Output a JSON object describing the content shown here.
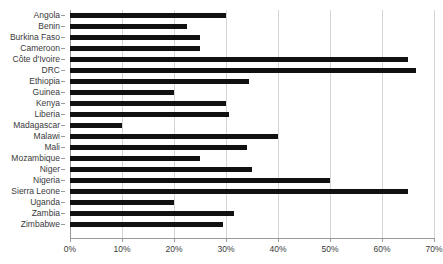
{
  "chart_data": {
    "type": "bar",
    "orientation": "horizontal",
    "title": "",
    "xlabel": "",
    "ylabel": "",
    "xlim": [
      0,
      70
    ],
    "grid": true,
    "legend": false,
    "xticks": [
      0,
      10,
      20,
      30,
      40,
      50,
      60,
      70
    ],
    "xtick_labels": [
      "0%",
      "10%",
      "20%",
      "30%",
      "40%",
      "50%",
      "60%",
      "70%"
    ],
    "categories": [
      "Angola",
      "Benin",
      "Burkina Faso",
      "Cameroon",
      "Côte d'Ivoire",
      "DRC",
      "Ethiopia",
      "Guinea",
      "Kenya",
      "Liberia",
      "Madagascar",
      "Malawi",
      "Mali",
      "Mozambique",
      "Niger",
      "Nigeria",
      "Sierra Leone",
      "Uganda",
      "Zambia",
      "Zimbabwe"
    ],
    "values": [
      30.0,
      22.5,
      25.0,
      25.0,
      65.0,
      66.5,
      34.5,
      20.0,
      30.0,
      30.5,
      10.0,
      40.0,
      34.0,
      25.0,
      35.0,
      50.0,
      65.0,
      20.0,
      31.5,
      29.5
    ],
    "bar_color": "#111111",
    "grid_color": "#d5d5d5",
    "axis_color": "#9a9a9a",
    "background": "#ffffff"
  }
}
